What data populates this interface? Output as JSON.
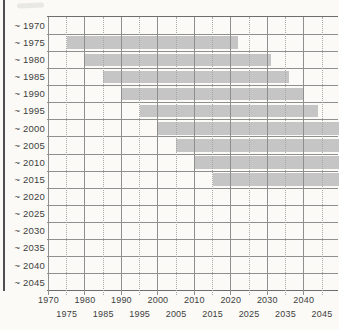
{
  "figure": {
    "colors": {
      "background": "#fbfaf7",
      "bar": "#c5c5c5",
      "grid_solid": "#8f8f8f",
      "grid_dotted": "#a8a8a8",
      "border": "#6e6e6e",
      "frame": "#4f4f4f",
      "text": "#3e3e3e"
    }
  },
  "chart_data": {
    "type": "bar",
    "orientation": "horizontal-span",
    "title": "",
    "xlabel": "",
    "ylabel": "",
    "grid": true,
    "legend": null,
    "x_axis": {
      "range": [
        1970,
        2050
      ],
      "major_ticks": [
        1970,
        1980,
        1990,
        2000,
        2010,
        2020,
        2030,
        2040
      ],
      "minor_ticks": [
        1975,
        1985,
        1995,
        2005,
        2015,
        2025,
        2035,
        2045
      ],
      "major_labels": [
        "1970",
        "1980",
        "1990",
        "2000",
        "2010",
        "2020",
        "2030",
        "2040"
      ],
      "minor_labels": [
        "1975",
        "1985",
        "1995",
        "2005",
        "2015",
        "2025",
        "2035",
        "2045"
      ]
    },
    "rows": [
      {
        "label": "~ 1970",
        "bar": null
      },
      {
        "label": "~ 1975",
        "bar": {
          "start": 1975,
          "end": 2022,
          "clipped": false
        }
      },
      {
        "label": "~ 1980",
        "bar": {
          "start": 1980,
          "end": 2031,
          "clipped": false
        }
      },
      {
        "label": "~ 1985",
        "bar": {
          "start": 1985,
          "end": 2036,
          "clipped": false
        }
      },
      {
        "label": "~ 1990",
        "bar": {
          "start": 1990,
          "end": 2040,
          "clipped": false
        }
      },
      {
        "label": "~ 1995",
        "bar": {
          "start": 1995,
          "end": 2044,
          "clipped": false
        }
      },
      {
        "label": "~ 2000",
        "bar": {
          "start": 2000,
          "end": 2050,
          "clipped": true
        }
      },
      {
        "label": "~ 2005",
        "bar": {
          "start": 2005,
          "end": 2050,
          "clipped": true
        }
      },
      {
        "label": "~ 2010",
        "bar": {
          "start": 2010,
          "end": 2050,
          "clipped": true
        }
      },
      {
        "label": "~ 2015",
        "bar": {
          "start": 2015,
          "end": 2050,
          "clipped": true
        }
      },
      {
        "label": "~ 2020",
        "bar": null
      },
      {
        "label": "~ 2025",
        "bar": null
      },
      {
        "label": "~ 2030",
        "bar": null
      },
      {
        "label": "~ 2035",
        "bar": null
      },
      {
        "label": "~ 2040",
        "bar": null
      },
      {
        "label": "~ 2045",
        "bar": null
      }
    ]
  }
}
